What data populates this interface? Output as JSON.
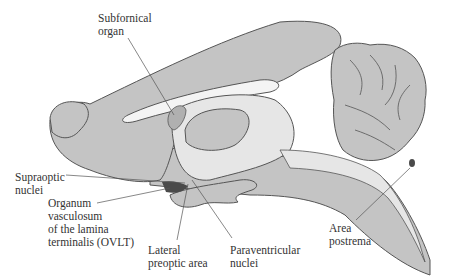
{
  "diagram": {
    "colors": {
      "tissue": "#c4c4c4",
      "tissue_light": "#dcdcdc",
      "ventricle": "#ececec",
      "outline": "#555555",
      "dark_organ": "#4a4a4a",
      "leader": "#555555",
      "text": "#333333"
    },
    "labels": {
      "subfornical_organ": "Subfornical\norgan",
      "supraoptic_nuclei": "Supraoptic\nnuclei",
      "ovlt": "Organum\nvasculosum\nof the lamina\nterminalis (OVLT)",
      "lateral_preoptic_area": "Lateral\npreoptic area",
      "paraventricular_nuclei": "Paraventricular\nnuclei",
      "area_postrema": "Area\npostrema"
    }
  }
}
